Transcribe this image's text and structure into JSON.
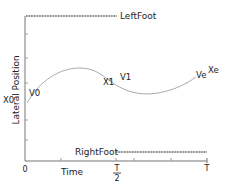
{
  "diagram": {
    "y_axis_label": "Lateral Position",
    "x_axis_label": "Time",
    "x_ticks": {
      "origin": "0",
      "half_num": "T",
      "half_den": "2",
      "end": "T"
    },
    "y_labels": {
      "start": "X0"
    },
    "feet": {
      "left": "LeftFoot",
      "right": "RightFoot"
    },
    "points": {
      "v0": "V0",
      "x1": "X1",
      "v1": "V1",
      "ve": "Ve",
      "xe": "Xe"
    },
    "colors": {
      "axis": "#777777",
      "curve": "#aaaaaa",
      "foot_line": "#555555",
      "text": "#222222"
    }
  }
}
